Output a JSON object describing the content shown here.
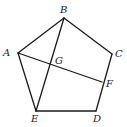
{
  "diagram": {
    "type": "geometry",
    "points": {
      "A": {
        "x": 18,
        "y": 53,
        "label": "A",
        "lx": 3,
        "ly": 56
      },
      "B": {
        "x": 64,
        "y": 18,
        "label": "B",
        "lx": 60,
        "ly": 13
      },
      "C": {
        "x": 112,
        "y": 54,
        "label": "C",
        "lx": 115,
        "ly": 57
      },
      "D": {
        "x": 96,
        "y": 111,
        "label": "D",
        "lx": 93,
        "ly": 122
      },
      "E": {
        "x": 36,
        "y": 111,
        "label": "E",
        "lx": 31,
        "ly": 122
      },
      "F": {
        "x": 102,
        "y": 82,
        "label": "F",
        "lx": 106,
        "ly": 87
      },
      "G": {
        "x": 50,
        "y": 63,
        "label": "G",
        "lx": 55,
        "ly": 64
      }
    },
    "segments": [
      [
        "A",
        "B"
      ],
      [
        "B",
        "C"
      ],
      [
        "C",
        "D"
      ],
      [
        "D",
        "E"
      ],
      [
        "E",
        "A"
      ],
      [
        "B",
        "E"
      ],
      [
        "A",
        "F"
      ]
    ],
    "stroke_color": "#1a1a1a"
  }
}
